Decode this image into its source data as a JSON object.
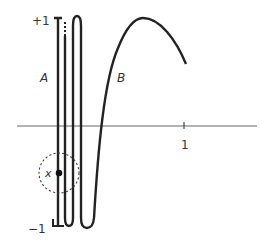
{
  "figure": {
    "labels": {
      "y_top": "+1",
      "y_bottom": "−1",
      "x_tick": "1",
      "curve_a": "A",
      "curve_b": "B",
      "point": "x"
    },
    "colors": {
      "ink": "#222222",
      "axis": "#555555",
      "background": "#ffffff"
    }
  }
}
